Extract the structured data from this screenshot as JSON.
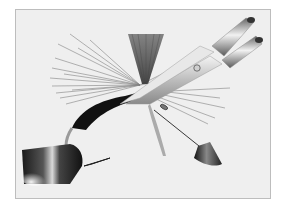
{
  "illustration": {
    "subject": "Fly tying: scissors trimming hackle on a dry fly held in a vise",
    "elements": [
      "vise-jaw",
      "hook",
      "fly-body",
      "hackle-fibers",
      "wing",
      "scissors",
      "bodkin-needle"
    ],
    "colors": {
      "background": "#ffffff",
      "frame_fill": "#efefef",
      "frame_border": "#bdbdbd",
      "metal_dark": "#222222",
      "metal_mid": "#7a7a7a",
      "metal_light": "#e6e6e6",
      "body": "#111111",
      "hackle": "#6e6e6e"
    }
  }
}
